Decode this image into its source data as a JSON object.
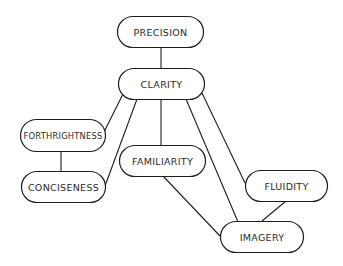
{
  "diagram": {
    "type": "concept-hierarchy",
    "colors": {
      "stroke": "#1e1e1e",
      "fill": "#ffffff",
      "text": "#2a2a2a",
      "background": "#ffffff"
    },
    "nodes": [
      {
        "id": "precision",
        "label": "PRECISION",
        "x": 117,
        "y": 16,
        "w": 86,
        "h": 31
      },
      {
        "id": "clarity",
        "label": "CLARITY",
        "x": 118,
        "y": 68,
        "w": 86,
        "h": 31
      },
      {
        "id": "forthrightness",
        "label": "FORTHRIGHTNESS",
        "x": 20,
        "y": 119,
        "w": 85,
        "h": 32
      },
      {
        "id": "conciseness",
        "label": "CONCISENESS",
        "x": 21,
        "y": 171,
        "w": 84,
        "h": 31
      },
      {
        "id": "familiarity",
        "label": "FAMILIARITY",
        "x": 119,
        "y": 145,
        "w": 86,
        "h": 31
      },
      {
        "id": "fluidity",
        "label": "FLUIDITY",
        "x": 245,
        "y": 170,
        "w": 82,
        "h": 31
      },
      {
        "id": "imagery",
        "label": "IMAGERY",
        "x": 220,
        "y": 221,
        "w": 83,
        "h": 31
      }
    ],
    "edges": [
      {
        "from": "precision",
        "to": "clarity",
        "x1": 161,
        "y1": 47,
        "x2": 161,
        "y2": 68
      },
      {
        "from": "clarity",
        "to": "forthrightness",
        "x1": 123,
        "y1": 94,
        "x2": 104,
        "y2": 132
      },
      {
        "from": "clarity",
        "to": "conciseness",
        "x1": 137,
        "y1": 99,
        "x2": 105,
        "y2": 186
      },
      {
        "from": "clarity",
        "to": "familiarity",
        "x1": 161,
        "y1": 99,
        "x2": 161,
        "y2": 145
      },
      {
        "from": "clarity",
        "to": "imagery",
        "x1": 186,
        "y1": 99,
        "x2": 238,
        "y2": 222
      },
      {
        "from": "clarity",
        "to": "fluidity",
        "x1": 202,
        "y1": 93,
        "x2": 245,
        "y2": 183
      },
      {
        "from": "forthrightness",
        "to": "conciseness",
        "x1": 61,
        "y1": 151,
        "x2": 61,
        "y2": 171
      },
      {
        "from": "familiarity",
        "to": "imagery",
        "x1": 163,
        "y1": 176,
        "x2": 220,
        "y2": 236
      },
      {
        "from": "fluidity",
        "to": "imagery",
        "x1": 286,
        "y1": 201,
        "x2": 262,
        "y2": 221
      }
    ]
  }
}
